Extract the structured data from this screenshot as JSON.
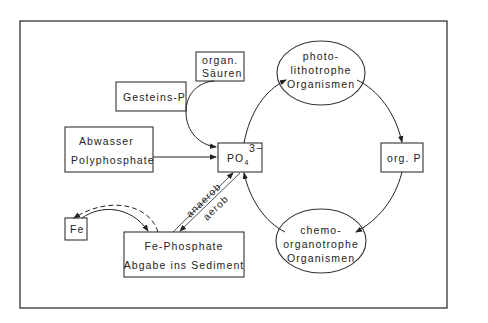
{
  "diagram": {
    "type": "phosphorus-cycle",
    "nodes": {
      "organ_saeuren": {
        "line1": "organ.",
        "line2": "Säuren"
      },
      "gesteins_p": {
        "label": "Gesteins-P"
      },
      "abwasser": {
        "line1": "Abwasser",
        "line2": "Polyphosphate"
      },
      "po4": {
        "label": "PO",
        "subscript": "4",
        "superscript": "3−"
      },
      "photo": {
        "line1": "photo-",
        "line2": "lithotrophe",
        "line3": "Organismen"
      },
      "org_p": {
        "label": "org. P"
      },
      "chemo": {
        "line1": "chemo-",
        "line2": "organotrophe",
        "line3": "Organismen"
      },
      "fe": {
        "label": "Fe"
      },
      "fe_phosphate": {
        "line1": "Fe-Phosphate",
        "line2": "Abgabe ins Sediment"
      }
    },
    "edge_labels": {
      "anaerob": "anaerob",
      "aerob": "aerob"
    },
    "edges": [
      {
        "from": "Gesteins-P",
        "to": "PO4",
        "style": "solid",
        "via": "organ. Säuren"
      },
      {
        "from": "Abwasser Polyphosphate",
        "to": "PO4",
        "style": "solid"
      },
      {
        "from": "PO4",
        "to": "photo-lithotrophe Organismen",
        "style": "solid"
      },
      {
        "from": "photo-lithotrophe Organismen",
        "to": "org. P",
        "style": "solid"
      },
      {
        "from": "org. P",
        "to": "chemo-organotrophe Organismen",
        "style": "solid"
      },
      {
        "from": "chemo-organotrophe Organismen",
        "to": "PO4",
        "style": "solid"
      },
      {
        "from": "Fe-Phosphate",
        "to": "PO4",
        "style": "solid",
        "label": "anaerob"
      },
      {
        "from": "PO4",
        "to": "Fe-Phosphate",
        "style": "solid",
        "label": "aerob"
      },
      {
        "from": "Fe",
        "to": "Fe-Phosphate",
        "style": "solid"
      },
      {
        "from": "Fe-Phosphate",
        "to": "Fe",
        "style": "dashed"
      }
    ]
  }
}
